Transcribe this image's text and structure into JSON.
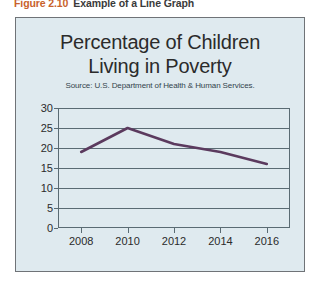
{
  "caption": {
    "figure_number": "Figure 2.10",
    "figure_title": "Example of a Line Graph",
    "number_color": "#c8622c",
    "title_color": "#3a3a3a"
  },
  "figure": {
    "background_color": "#dfeaef",
    "border_color": "#6f7377"
  },
  "chart_data": {
    "type": "line",
    "title": "Percentage of Children Living in Poverty",
    "title_line_1": "Percentage of Children",
    "title_line_2": "Living in Poverty",
    "subtitle": "Source: U.S. Department of Health & Human Services.",
    "xlabel": "",
    "ylabel": "",
    "x": [
      2008,
      2010,
      2012,
      2014,
      2016
    ],
    "values": [
      19,
      25,
      21,
      19,
      16
    ],
    "categories": [
      "2008",
      "2010",
      "2012",
      "2014",
      "2016"
    ],
    "xtick_labels": [
      "2008",
      "2010",
      "2012",
      "2014",
      "2016"
    ],
    "ytick_labels": [
      "0",
      "5",
      "10",
      "15",
      "20",
      "25",
      "30"
    ],
    "ytick_values": [
      0,
      5,
      10,
      15,
      20,
      25,
      30
    ],
    "ylim": [
      0,
      30
    ],
    "xlim": [
      2007,
      2017
    ],
    "grid": true,
    "legend": null,
    "line_color": "#5b3a5e",
    "line_width": 2.6,
    "series": [
      {
        "name": "Percentage of children living in poverty",
        "values": [
          19,
          25,
          21,
          19,
          16
        ]
      }
    ]
  }
}
